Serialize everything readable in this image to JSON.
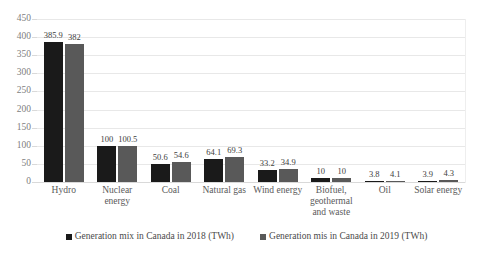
{
  "chart_data": {
    "type": "bar",
    "title": "",
    "subtitle": "",
    "xlabel": "",
    "ylabel": "",
    "ylim": [
      0,
      450
    ],
    "ytick_step": 50,
    "yticks": [
      "450",
      "400",
      "350",
      "300",
      "250",
      "200",
      "150",
      "100",
      "50",
      "0"
    ],
    "grid": true,
    "legend_position": "bottom",
    "categories": [
      "Hydro",
      "Nuclear energy",
      "Coal",
      "Natural gas",
      "Wind energy",
      "Biofuel, geothermal and waste",
      "Oil",
      "Solar energy"
    ],
    "series": [
      {
        "name": "Generation mix in Canada in 2018 (TWh)",
        "color": "#1a1a1a",
        "values": [
          385.9,
          100,
          50.6,
          64.1,
          33.2,
          10,
          3.8,
          3.9
        ],
        "labels": [
          "385.9",
          "100",
          "50.6",
          "64.1",
          "33.2",
          "10",
          "3.8",
          "3.9"
        ]
      },
      {
        "name": "Generation mis in Canada in 2019 (TWh)",
        "color": "#595959",
        "values": [
          382,
          100.5,
          54.6,
          69.3,
          34.9,
          10,
          4.1,
          4.3
        ],
        "labels": [
          "382",
          "100.5",
          "54.6",
          "69.3",
          "34.9",
          "10",
          "4.1",
          "4.3"
        ]
      }
    ]
  },
  "axis": {
    "y": {
      "ticks": [
        "450",
        "400",
        "350",
        "300",
        "250",
        "200",
        "150",
        "100",
        "50",
        "0"
      ]
    },
    "x": {
      "labels": [
        {
          "line1": "Hydro",
          "line2": "",
          "line3": ""
        },
        {
          "line1": "Nuclear",
          "line2": "energy",
          "line3": ""
        },
        {
          "line1": "Coal",
          "line2": "",
          "line3": ""
        },
        {
          "line1": "Natural gas",
          "line2": "",
          "line3": ""
        },
        {
          "line1": "Wind energy",
          "line2": "",
          "line3": ""
        },
        {
          "line1": "Biofuel,",
          "line2": "geothermal",
          "line3": "and waste"
        },
        {
          "line1": "Oil",
          "line2": "",
          "line3": ""
        },
        {
          "line1": "Solar energy",
          "line2": "",
          "line3": ""
        }
      ]
    }
  },
  "legend": {
    "items": [
      {
        "label": "Generation mix in Canada in 2018 (TWh)",
        "color": "#1a1a1a"
      },
      {
        "label": "Generation mis in Canada in 2019 (TWh)",
        "color": "#595959"
      }
    ]
  }
}
